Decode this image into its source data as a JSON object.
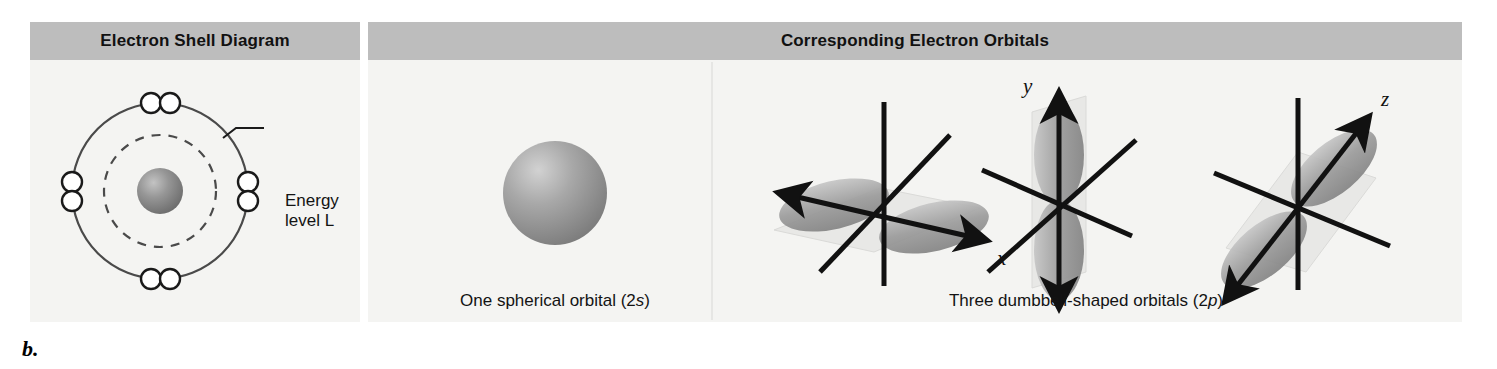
{
  "figure": {
    "letter": "b.",
    "background_color": "#ffffff",
    "panel_color": "#f4f4f2",
    "header_color": "#bdbdbd",
    "ink_color": "#131313"
  },
  "headers": [
    {
      "id": "shell",
      "label": "Electron Shell Diagram"
    },
    {
      "id": "orbitals",
      "label": "Corresponding Electron Orbitals"
    }
  ],
  "shell_diagram": {
    "nucleus": {
      "label": "nucleus",
      "color": "#8a8a8a"
    },
    "inner_shell": {
      "label": "energy level K",
      "style": "dashed"
    },
    "outer_shell": {
      "label": "energy level L",
      "style": "solid"
    },
    "electron_count": 8,
    "electron_pairs": [
      {
        "position": "top",
        "orientation": "horizontal"
      },
      {
        "position": "right",
        "orientation": "vertical"
      },
      {
        "position": "bottom",
        "orientation": "horizontal"
      },
      {
        "position": "left",
        "orientation": "vertical"
      }
    ],
    "callout": {
      "line1": "Energy",
      "line2": "level L"
    }
  },
  "orbitals": {
    "s_orbital": {
      "caption_prefix": "One spherical orbital (2",
      "caption_italic": "s",
      "caption_suffix": ")",
      "shape": "sphere",
      "color": "#9a9a9a"
    },
    "p_orbitals": {
      "caption_prefix": "Three dumbbell-shaped orbitals (2",
      "caption_italic": "p",
      "caption_suffix": ")",
      "shape": "dumbbell",
      "color": "#9a9a9a",
      "axes": [
        {
          "axis_label": "x",
          "lobe_direction": "upper-left to lower-right",
          "plane": "horizontal"
        },
        {
          "axis_label": "y",
          "lobe_direction": "vertical",
          "plane": "vertical"
        },
        {
          "axis_label": "z",
          "lobe_direction": "upper-right to lower-left",
          "plane": "oblique"
        }
      ]
    }
  }
}
